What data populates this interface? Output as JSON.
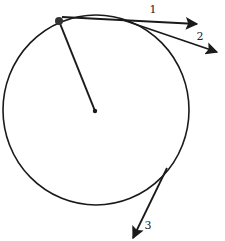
{
  "diagram": {
    "type": "circular-motion-tangent-vectors",
    "colors": {
      "stroke": "#1a1a1a",
      "background": "#ffffff"
    },
    "circle": {
      "cx": 96,
      "cy": 110,
      "rx": 93,
      "ry": 95
    },
    "center_point": {
      "x": 95,
      "y": 111
    },
    "object_point": {
      "x": 59,
      "y": 21
    },
    "radius_line": {
      "from": "object_point",
      "to": "center_point"
    },
    "arrows": [
      {
        "id": "1",
        "label": "1",
        "x1": 62,
        "y1": 17,
        "x2": 197,
        "y2": 24,
        "label_x": 153,
        "label_y": 13
      },
      {
        "id": "2",
        "label": "2",
        "x1": 120,
        "y1": 19,
        "x2": 217,
        "y2": 52,
        "label_x": 200,
        "label_y": 40
      },
      {
        "id": "3",
        "label": "3",
        "x1": 167,
        "y1": 168,
        "x2": 133,
        "y2": 238,
        "label_x": 148,
        "label_y": 229
      }
    ]
  }
}
